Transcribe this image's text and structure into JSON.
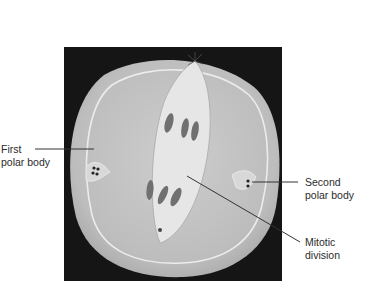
{
  "figure": {
    "colors": {
      "background": "#ffffff",
      "photo_frame": "#151515",
      "cell_body": "#c9c9c9",
      "spindle": "#e4e4e4",
      "chromosomes": "#6e6e6e",
      "label_text": "#2b2b2b",
      "leader_line": "#333333"
    }
  },
  "labels": {
    "first_polar_body": {
      "line1": "First",
      "line2": "polar body"
    },
    "second_polar_body": {
      "line1": "Second",
      "line2": "polar body"
    },
    "mitotic_division": {
      "line1": "Mitotic division"
    }
  }
}
